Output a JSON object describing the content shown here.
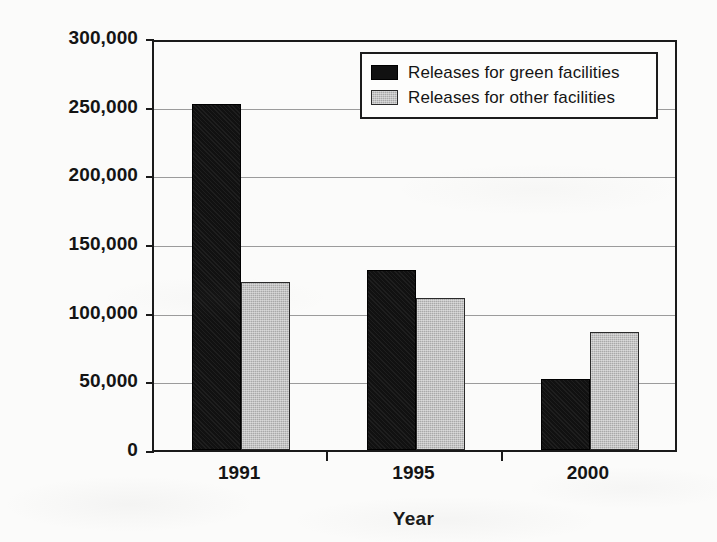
{
  "chart_data": {
    "type": "bar",
    "title": "",
    "xlabel": "Year",
    "ylabel": "Pounds of Pollution",
    "categories": [
      "1991",
      "1995",
      "2000"
    ],
    "series": [
      {
        "name": "Releases for green facilities",
        "color": "#111111",
        "values": [
          252000,
          131000,
          52000
        ]
      },
      {
        "name": "Releases for other facilities",
        "color": "#a9a9a9",
        "values": [
          122000,
          111000,
          86000
        ]
      }
    ],
    "ylim": [
      0,
      300000
    ],
    "ytick_values": [
      0,
      50000,
      100000,
      150000,
      200000,
      250000,
      300000
    ],
    "ytick_labels": [
      "0",
      "50,000",
      "100,000",
      "150,000",
      "200,000",
      "250,000",
      "300,000"
    ],
    "grid": true,
    "legend_position": "top-right"
  },
  "legend": {
    "items": [
      {
        "label": "Releases for green facilities",
        "swatch": "black-square-icon"
      },
      {
        "label": "Releases for other facilities",
        "swatch": "gray-square-icon"
      }
    ]
  }
}
